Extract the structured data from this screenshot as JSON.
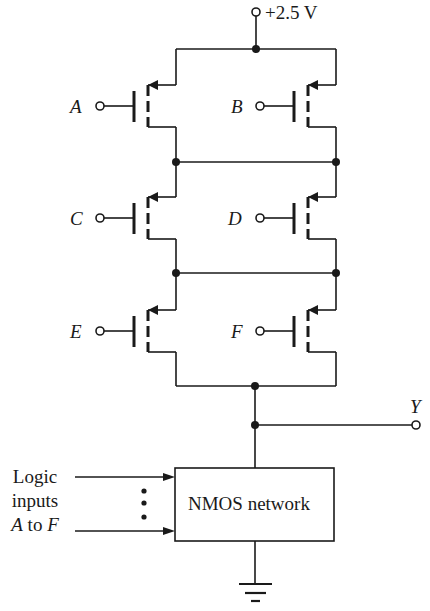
{
  "supply": {
    "label": "+2.5 V"
  },
  "transistors": [
    {
      "gate": "A",
      "type": "PMOS",
      "position": "top-left"
    },
    {
      "gate": "B",
      "type": "PMOS",
      "position": "top-right"
    },
    {
      "gate": "C",
      "type": "PMOS",
      "position": "middle-left"
    },
    {
      "gate": "D",
      "type": "PMOS",
      "position": "middle-right"
    },
    {
      "gate": "E",
      "type": "PMOS",
      "position": "bottom-left"
    },
    {
      "gate": "F",
      "type": "PMOS",
      "position": "bottom-right"
    }
  ],
  "output": {
    "label": "Y"
  },
  "nmos_block": {
    "label": "NMOS network"
  },
  "logic_inputs": {
    "line1": "Logic",
    "line2": "inputs",
    "line3_a": "A",
    "line3_to": " to ",
    "line3_f": "F"
  },
  "colors": {
    "stroke": "#1a1a1a",
    "background": "#ffffff"
  }
}
